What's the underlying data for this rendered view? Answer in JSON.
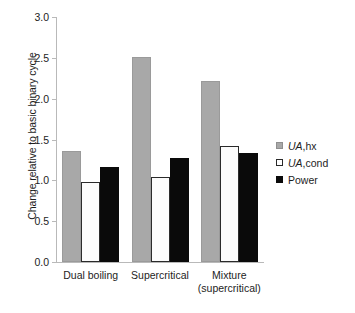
{
  "chart_data": {
    "type": "bar",
    "title": "",
    "xlabel": "",
    "ylabel": "Change relative to basic binary cycle",
    "ylim": [
      0.0,
      3.0
    ],
    "ytick_labels": [
      "3.0",
      "2.5",
      "2.0",
      "1.5",
      "1.0",
      "0.5",
      "0.0"
    ],
    "ytick_values": [
      3.0,
      2.5,
      2.0,
      1.5,
      1.0,
      0.5,
      0.0
    ],
    "grid": false,
    "legend_position": "right",
    "categories": [
      "Dual boiling",
      "Supercritical",
      "Mixture (supercritical)"
    ],
    "category_lines": [
      [
        "Dual boiling"
      ],
      [
        "Supercritical"
      ],
      [
        "Mixture",
        "(supercritical)"
      ]
    ],
    "series": [
      {
        "name": "UA,hx",
        "name_italic_prefix": "UA",
        "name_rest": ",hx",
        "color": "#a8a8a8",
        "values": [
          1.36,
          2.51,
          2.22
        ]
      },
      {
        "name": "UA,cond",
        "name_italic_prefix": "UA",
        "name_rest": ",cond",
        "color": "#ffffff",
        "values": [
          0.98,
          1.04,
          1.42
        ]
      },
      {
        "name": "Power",
        "name_italic_prefix": "",
        "name_rest": "Power",
        "color": "#0a0a0a",
        "values": [
          1.16,
          1.27,
          1.34
        ]
      }
    ]
  }
}
